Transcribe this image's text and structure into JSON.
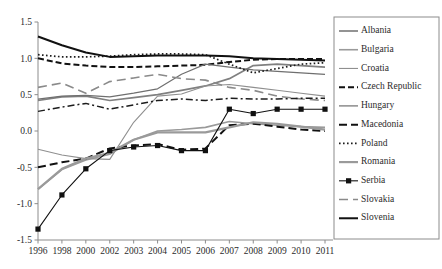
{
  "chart_data": {
    "type": "line",
    "title": "",
    "subtitle": "",
    "xlabel": "",
    "ylabel": "",
    "grid": false,
    "legend_position": "right",
    "ylim": [
      -1.5,
      1.5
    ],
    "yticks": [
      "1.5",
      "1.0",
      "0.5",
      "0.0",
      "-0.5",
      "-1.0",
      "-1.5"
    ],
    "ytick_values": [
      1.5,
      1.0,
      0.5,
      0.0,
      -0.5,
      -1.0,
      -1.5
    ],
    "categories": [
      "1996",
      "1998",
      "2000",
      "2002",
      "2003",
      "2004",
      "2005",
      "2006",
      "2007",
      "2008",
      "2009",
      "2010",
      "2011"
    ],
    "series": [
      {
        "name": "Albania",
        "color": "#808080",
        "width": 1.7,
        "dash": "none",
        "marker": "none",
        "values": [
          0.42,
          0.47,
          0.48,
          0.42,
          0.46,
          0.5,
          0.56,
          0.62,
          0.72,
          0.9,
          0.92,
          0.9,
          0.88
        ]
      },
      {
        "name": "Bulgaria",
        "color": "#9a9a9a",
        "width": 1.6,
        "dash": "none",
        "marker": "none",
        "values": [
          -0.8,
          -0.53,
          -0.4,
          -0.32,
          -0.12,
          0.0,
          0.02,
          0.05,
          0.13,
          0.1,
          0.08,
          0.06,
          0.05
        ]
      },
      {
        "name": "Croatia",
        "color": "#8f8f8f",
        "width": 1.1,
        "dash": "none",
        "marker": "none",
        "values": [
          -0.25,
          -0.33,
          -0.38,
          -0.39,
          0.12,
          0.48,
          0.51,
          0.62,
          0.64,
          0.6,
          0.56,
          0.52,
          0.48
        ]
      },
      {
        "name": "Czech Republic",
        "color": "#111111",
        "width": 2.0,
        "dash": "6,3",
        "marker": "none",
        "values": [
          1.0,
          0.93,
          0.9,
          0.88,
          0.88,
          0.89,
          0.9,
          0.91,
          0.95,
          0.98,
          0.99,
          0.99,
          0.99
        ]
      },
      {
        "name": "Hungary",
        "color": "#6f6f6f",
        "width": 1.2,
        "dash": "none",
        "marker": "none",
        "values": [
          0.44,
          0.48,
          0.49,
          0.47,
          0.52,
          0.58,
          0.78,
          0.92,
          0.88,
          0.84,
          0.82,
          0.8,
          0.78
        ]
      },
      {
        "name": "Macedonia",
        "color": "#111111",
        "width": 2.0,
        "dash": "8,4",
        "marker": "none",
        "values": [
          -0.5,
          -0.43,
          -0.38,
          -0.24,
          -0.2,
          -0.18,
          -0.26,
          -0.24,
          0.08,
          0.1,
          0.06,
          0.02,
          0.0
        ]
      },
      {
        "name": "Poland",
        "color": "#1c1c1c",
        "width": 1.7,
        "dash": "1.6,2.4",
        "marker": "none",
        "values": [
          1.05,
          1.02,
          1.02,
          1.03,
          1.05,
          1.06,
          1.06,
          1.05,
          0.92,
          0.8,
          0.86,
          0.92,
          0.94
        ]
      },
      {
        "name": "Romania",
        "color": "#9a9a9a",
        "width": 2.2,
        "dash": "none",
        "marker": "none",
        "values": [
          -0.8,
          -0.52,
          -0.38,
          -0.3,
          -0.12,
          -0.02,
          -0.02,
          -0.02,
          0.05,
          0.12,
          0.1,
          0.06,
          0.02
        ]
      },
      {
        "name": "Serbia",
        "color": "#111111",
        "width": 1.1,
        "dash": "none",
        "marker": "square",
        "values": [
          -1.35,
          -0.88,
          -0.52,
          -0.27,
          -0.22,
          -0.2,
          -0.27,
          -0.27,
          0.3,
          0.24,
          0.3,
          0.3,
          0.3
        ]
      },
      {
        "name": "Slovakia",
        "color": "#8a8a8a",
        "width": 1.6,
        "dash": "9,5",
        "marker": "none",
        "values": [
          0.6,
          0.66,
          0.52,
          0.68,
          0.73,
          0.78,
          0.72,
          0.7,
          0.6,
          0.56,
          0.48,
          0.44,
          0.42
        ]
      },
      {
        "name": "Slovenia",
        "color": "#111111",
        "width": 2.0,
        "dash": "none",
        "marker": "none",
        "values": [
          1.3,
          1.18,
          1.08,
          1.02,
          1.03,
          1.04,
          1.04,
          1.04,
          1.03,
          1.0,
          0.99,
          0.98,
          0.97
        ]
      },
      {
        "name": "Macedonia-dashdot",
        "color": "#1c1c1c",
        "width": 1.5,
        "dash": "7,3,2,3",
        "marker": "none",
        "values": [
          0.27,
          0.33,
          0.38,
          0.3,
          0.36,
          0.42,
          0.44,
          0.42,
          0.45,
          0.44,
          0.44,
          0.45,
          0.45
        ]
      }
    ]
  },
  "legend": {
    "entries": [
      "Albania",
      "Bulgaria",
      "Croatia",
      "Czech Republic",
      "Hungary",
      "Macedonia",
      "Poland",
      "Romania",
      "Serbia",
      "Slovakia",
      "Slovenia"
    ]
  }
}
